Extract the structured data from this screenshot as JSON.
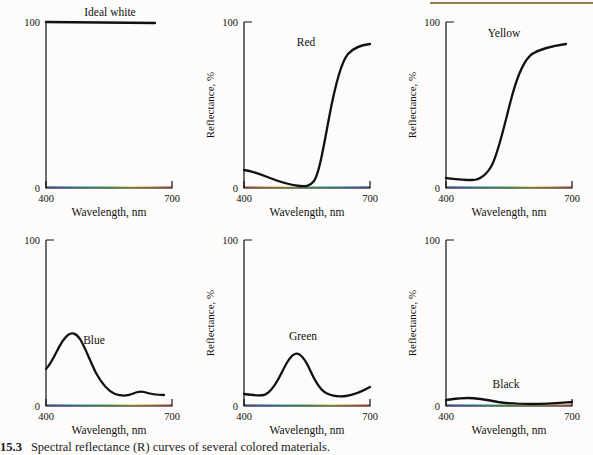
{
  "figure": {
    "caption_number": "15.3",
    "caption_text": "Spectral reflectance (R) curves of several colored materials.",
    "background_color": "#fdfcfa",
    "rule_color": "#9a7a4e",
    "curve_color": "#111111"
  },
  "axes": {
    "x_title": "Wavelength, nm",
    "y_title": "Reflectance, %",
    "x_ticks": [
      "400",
      "700"
    ],
    "y_ticks": [
      "100",
      "0"
    ],
    "xlim": [
      400,
      700
    ],
    "ylim": [
      0,
      100
    ]
  },
  "chart_data": {
    "type": "line",
    "title": "Spectral reflectance (R) curves of several colored materials.",
    "xlabel": "Wavelength, nm",
    "ylabel": "Reflectance, %",
    "xlim": [
      400,
      700
    ],
    "ylim": [
      0,
      100
    ],
    "grid": false,
    "legend": "inline-annotations",
    "x": [
      400,
      420,
      440,
      460,
      480,
      500,
      520,
      540,
      560,
      580,
      600,
      620,
      640,
      660,
      680,
      700
    ],
    "series": [
      {
        "name": "Ideal white",
        "annotation": "Ideal white",
        "panel": 1,
        "values": [
          97,
          97,
          97,
          97,
          97,
          97,
          97,
          97,
          97,
          97,
          97,
          97,
          97,
          97,
          97,
          97
        ]
      },
      {
        "name": "Red",
        "annotation": "Red",
        "panel": 2,
        "values": [
          8,
          7,
          6,
          5,
          4,
          4,
          3,
          3,
          3,
          4,
          12,
          45,
          68,
          76,
          79,
          80
        ]
      },
      {
        "name": "Yellow",
        "annotation": "Yellow",
        "panel": 3,
        "values": [
          6,
          6,
          5,
          5,
          6,
          12,
          33,
          58,
          72,
          78,
          80,
          81,
          82,
          82,
          83,
          84
        ]
      },
      {
        "name": "Blue",
        "annotation": "Blue",
        "panel": 4,
        "values": [
          19,
          26,
          31,
          32,
          29,
          24,
          18,
          13,
          10,
          8,
          7,
          7,
          8,
          8,
          7,
          7
        ]
      },
      {
        "name": "Green",
        "annotation": "Green",
        "panel": 5,
        "values": [
          8,
          7,
          7,
          9,
          15,
          21,
          23,
          21,
          15,
          10,
          7,
          6,
          6,
          7,
          9,
          12
        ]
      },
      {
        "name": "Black",
        "annotation": "Black",
        "panel": 6,
        "values": [
          4,
          5,
          5,
          5,
          4,
          4,
          3,
          3,
          3,
          3,
          2,
          2,
          2,
          2,
          2,
          3
        ]
      }
    ]
  },
  "panels": [
    {
      "id": "ideal-white",
      "label": "Ideal white",
      "label_x": 110,
      "label_y": 22,
      "show_ylabel": false,
      "path": "M46,22 L155,23",
      "strip_colors": [
        "#2b1f8e",
        "#1b6fd1",
        "#13b2a8",
        "#3bbd3b",
        "#d8d23a",
        "#e08a2a",
        "#c22a26"
      ],
      "strip_reverse": false
    },
    {
      "id": "red",
      "label": "Red",
      "label_x": 108,
      "label_y": 46,
      "show_ylabel": true,
      "path": "M46,170 C54,171 62,174 72,178 C82,182 92,185 102,186 C108,186.5 112,186 116,181 C121,174 125,150 131,118 C137,86 143,62 150,54 C156,47 163,45 172,44",
      "strip_colors": [
        "#c22a26",
        "#e08a2a",
        "#d8d23a",
        "#3bbd3b",
        "#13b2a8",
        "#1b6fd1",
        "#2b1f8e"
      ],
      "strip_reverse": true
    },
    {
      "id": "yellow",
      "label": "Yellow",
      "label_x": 104,
      "label_y": 37,
      "show_ylabel": true,
      "path": "M46,178 C55,179 63,180 72,180 C80,180 86,176 92,165 C99,151 105,122 112,96 C118,74 124,60 132,54 C140,49 152,46 166,44",
      "strip_colors": [
        "#2b1f8e",
        "#1b6fd1",
        "#13b2a8",
        "#3bbd3b",
        "#d8d23a",
        "#e08a2a",
        "#c22a26"
      ],
      "strip_reverse": false
    },
    {
      "id": "blue",
      "label": "Blue",
      "label_x": 84,
      "label_y": 126,
      "show_ylabel": false,
      "path": "M46,151 C50,147 53,141 57,133 C60,127 64,120 68,117 C72,114 76,115 80,121 C85,129 90,143 96,155 C102,166 108,173 115,176 C121,178 127,178 132,176 C136,174 140,173 144,174 C150,176 156,177 164,177",
      "strip_colors": [
        "#2b1f8e",
        "#1b6fd1",
        "#13b2a8",
        "#3bbd3b",
        "#d8d23a",
        "#e08a2a",
        "#c22a26"
      ],
      "strip_reverse": false
    },
    {
      "id": "green",
      "label": "Green",
      "label_x": 100,
      "label_y": 122,
      "show_ylabel": true,
      "path": "M46,176 C53,177 60,178 66,177 C72,175 77,168 83,156 C88,146 92,138 97,136 C102,134 107,141 112,152 C117,163 122,172 128,175 C134,178 141,179 148,178 C156,177 163,174 172,169",
      "strip_colors": [
        "#2b1f8e",
        "#1b6fd1",
        "#13b2a8",
        "#3bbd3b",
        "#d8d23a",
        "#e08a2a",
        "#c22a26"
      ],
      "strip_reverse": false
    },
    {
      "id": "black",
      "label": "Black",
      "label_x": 104,
      "label_y": 170,
      "show_ylabel": true,
      "path": "M46,182 C54,181 60,180 68,180 C78,180 88,182 98,184 C110,186 122,186 134,186 C146,186 158,185 172,184",
      "strip_colors": [
        "#2b1f8e",
        "#1b6fd1",
        "#13b2a8",
        "#3bbd3b",
        "#d8d23a",
        "#e08a2a",
        "#c22a26"
      ],
      "strip_reverse": false
    }
  ]
}
